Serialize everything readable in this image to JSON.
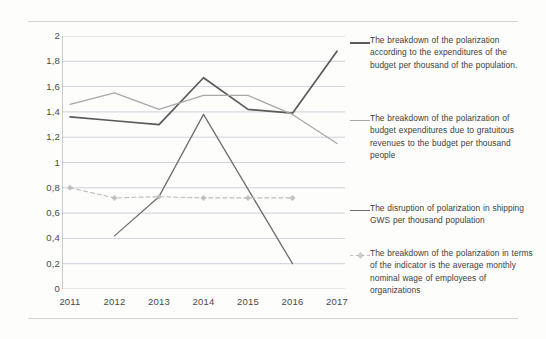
{
  "chart_data": {
    "type": "line",
    "title": "",
    "xlabel": "",
    "ylabel": "",
    "categories": [
      "2011",
      "2012",
      "2013",
      "2014",
      "2015",
      "2016",
      "2017"
    ],
    "ylim": [
      0,
      2
    ],
    "yticks": [
      "0",
      "0,2",
      "0,4",
      "0,6",
      "0,8",
      "1",
      "1,2",
      "1,4",
      "1,6",
      "1,8",
      "2"
    ],
    "ytick_values": [
      0,
      0.2,
      0.4,
      0.6,
      0.8,
      1,
      1.2,
      1.4,
      1.6,
      1.8,
      2
    ],
    "grid": true,
    "legend_position": "right",
    "series": [
      {
        "name": "The breakdown of the polarization according to the expenditures of the budget per thousand of the population.",
        "color": "#5a5a5a",
        "style": "solid",
        "marker": "none",
        "width": 1.7,
        "x": [
          "2011",
          "2012",
          "2013",
          "2014",
          "2015",
          "2016",
          "2017"
        ],
        "values": [
          1.36,
          1.33,
          1.3,
          1.67,
          1.42,
          1.39,
          1.88
        ]
      },
      {
        "name": "The breakdown of the polarization of budget expenditures due to gratuitous revenues to the budget per thousand people",
        "color": "#a8a8a8",
        "style": "solid",
        "marker": "none",
        "width": 1.3,
        "x": [
          "2011",
          "2012",
          "2013",
          "2014",
          "2015",
          "2016",
          "2017"
        ],
        "values": [
          1.46,
          1.55,
          1.42,
          1.53,
          1.53,
          1.38,
          1.15
        ]
      },
      {
        "name": "The disruption of polarization in shipping GWS per thousand population",
        "color": "#6e6e6e",
        "style": "solid",
        "marker": "none",
        "width": 1.3,
        "x": [
          "2012",
          "2013",
          "2014",
          "2015",
          "2016"
        ],
        "values": [
          0.42,
          0.73,
          1.38,
          0.79,
          0.2
        ]
      },
      {
        "name": "The breakdown of the polarization in terms of the indicator is the average monthly nominal wage of employees of organizations",
        "color": "#bdbdbd",
        "style": "dashed",
        "marker": "diamond",
        "width": 1.1,
        "x": [
          "2011",
          "2012",
          "2013",
          "2014",
          "2015",
          "2016"
        ],
        "values": [
          0.8,
          0.72,
          0.73,
          0.72,
          0.72,
          0.72
        ]
      }
    ]
  }
}
